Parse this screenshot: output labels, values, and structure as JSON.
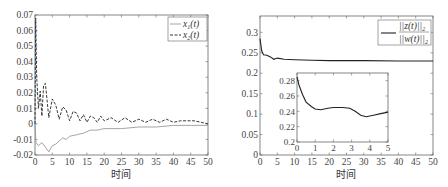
{
  "chart_data": [
    {
      "type": "line",
      "title": "",
      "xlabel": "时间",
      "ylabel": "",
      "xlim": [
        0,
        50
      ],
      "ylim": [
        -0.02,
        0.07
      ],
      "xticks": [
        "0",
        "5",
        "10",
        "15",
        "20",
        "25",
        "30",
        "35",
        "40",
        "45",
        "50"
      ],
      "yticks": [
        "-0.02",
        "-0.01",
        "0",
        "0.01",
        "0.02",
        "0.03",
        "0.04",
        "0.05",
        "0.06",
        "0.07"
      ],
      "grid": false,
      "legend_position": "upper right",
      "series": [
        {
          "name": "x1(t)",
          "style": "solid gray",
          "x": [
            0,
            0.3,
            1,
            2,
            3,
            4,
            5,
            6,
            7,
            8,
            9,
            10,
            12,
            14,
            16,
            18,
            20,
            25,
            30,
            35,
            40,
            45,
            50
          ],
          "values": [
            0.0,
            -0.012,
            -0.014,
            -0.012,
            -0.015,
            -0.018,
            -0.014,
            -0.013,
            -0.011,
            -0.009,
            -0.01,
            -0.008,
            -0.007,
            -0.006,
            -0.004,
            -0.004,
            -0.003,
            -0.003,
            -0.002,
            -0.002,
            -0.001,
            -0.001,
            -0.001
          ]
        },
        {
          "name": "x2(t)",
          "style": "dashed black",
          "x": [
            0,
            0.2,
            0.5,
            1,
            1.5,
            2,
            2.5,
            3,
            4,
            5,
            6,
            7,
            8,
            9,
            10,
            11,
            12,
            13,
            14,
            15,
            16,
            17,
            18,
            19,
            20,
            22,
            24,
            26,
            28,
            30,
            32,
            34,
            36,
            38,
            40,
            42,
            44,
            46,
            48,
            50
          ],
          "values": [
            0.0,
            0.068,
            0.03,
            0.01,
            0.021,
            0.005,
            0.025,
            0.026,
            0.004,
            0.016,
            0.012,
            0.003,
            0.011,
            0.009,
            0.002,
            0.008,
            0.007,
            0.002,
            0.006,
            0.001,
            0.005,
            0.004,
            0.001,
            0.005,
            0.002,
            0.004,
            0.001,
            0.004,
            0.001,
            0.003,
            0.001,
            0.003,
            0.001,
            0.003,
            0.001,
            0.002,
            0.002,
            0.002,
            0.001,
            0.0
          ]
        }
      ]
    },
    {
      "type": "line",
      "title": "",
      "xlabel": "时间",
      "ylabel": "",
      "xlim": [
        0,
        50
      ],
      "ylim": [
        0,
        0.34
      ],
      "xticks": [
        "0",
        "5",
        "10",
        "15",
        "20",
        "25",
        "30",
        "35",
        "40",
        "45",
        "50"
      ],
      "yticks": [
        "0",
        "0.05",
        "0.1",
        "0.15",
        "0.2",
        "0.25",
        "0.3"
      ],
      "grid": false,
      "legend_position": "upper right",
      "series": [
        {
          "name": "||z(t)||2 / ||w(t)||2",
          "style": "solid black",
          "x": [
            0,
            0.5,
            1,
            2,
            3,
            4,
            5,
            7,
            10,
            15,
            20,
            30,
            40,
            50
          ],
          "values": [
            0.285,
            0.255,
            0.245,
            0.244,
            0.24,
            0.234,
            0.237,
            0.234,
            0.233,
            0.232,
            0.231,
            0.231,
            0.23,
            0.23
          ]
        }
      ],
      "inset": {
        "xlim": [
          0,
          5
        ],
        "ylim": [
          0.2,
          0.29
        ],
        "xticks": [
          "0",
          "1",
          "2",
          "3",
          "4",
          "5"
        ],
        "yticks": [
          "0.2",
          "0.22",
          "0.24",
          "0.26",
          "0.28"
        ],
        "x": [
          0,
          0.1,
          0.3,
          0.5,
          0.8,
          1.0,
          1.3,
          1.7,
          2.0,
          2.5,
          2.9,
          3.2,
          3.5,
          3.8,
          4.2,
          4.6,
          5.0
        ],
        "values": [
          0.285,
          0.275,
          0.262,
          0.252,
          0.246,
          0.243,
          0.242,
          0.244,
          0.245,
          0.245,
          0.244,
          0.24,
          0.235,
          0.233,
          0.235,
          0.237,
          0.239
        ]
      }
    }
  ]
}
